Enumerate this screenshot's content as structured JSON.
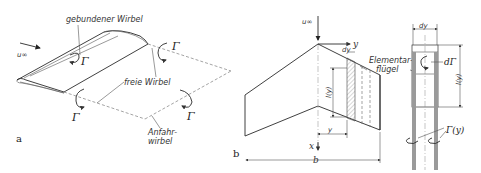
{
  "figure": {
    "panel_a": {
      "label": "a",
      "freestream": "u∞",
      "bound_vortex": "gebundener Wirbel",
      "free_vortex": "freie Wirbel",
      "starting_vortex_line1": "Anfahr-",
      "starting_vortex_line2": "wirbel",
      "circulation": "Γ"
    },
    "panel_b": {
      "label": "b",
      "freestream": "u∞",
      "y_axis": "y",
      "x_axis": "x",
      "dy": "dy",
      "chord": "l(y)",
      "y_dim": "y",
      "span": "b",
      "element_wing_line1": "Elementar-",
      "element_wing_line2": "flügel"
    },
    "panel_c": {
      "dy": "dy",
      "d_gamma": "dΓ",
      "chord": "l(y)",
      "gamma_y": "Γ(y)"
    }
  }
}
